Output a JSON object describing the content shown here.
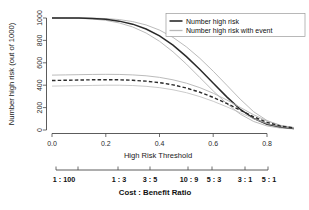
{
  "chart_data": {
    "type": "line",
    "title": "",
    "xlabel": "High Risk Threshold",
    "ylabel": "Number high risk (out of 1000)",
    "xlim": [
      -0.02,
      0.92
    ],
    "ylim": [
      0,
      1030
    ],
    "xticks": [
      0.0,
      0.2,
      0.4,
      0.6,
      0.8
    ],
    "xticklabels": [
      "0.0",
      "0.2",
      "0.4",
      "0.6",
      "0.8"
    ],
    "yticks": [
      0,
      200,
      400,
      600,
      800,
      1000
    ],
    "yticklabels": [
      "0",
      "200",
      "400",
      "600",
      "800",
      "1000"
    ],
    "grid": false,
    "legend": {
      "position": "top-right",
      "entries": [
        {
          "label": "Number high risk",
          "style": "solid-dark",
          "color": "#2a2a2a"
        },
        {
          "label": "Number high risk with event",
          "style": "solid-light",
          "color": "#b9b9b9"
        }
      ]
    },
    "secondary_axis": {
      "title": "Cost : Benefit Ratio",
      "ticks": [
        0.01,
        0.1,
        0.25,
        0.375,
        0.526,
        0.625,
        0.75,
        0.833
      ],
      "labels": [
        "1 : 100",
        "",
        "1 : 3",
        "3 : 5",
        "10 : 9",
        "5 : 3",
        "3 : 1",
        "5 : 1"
      ],
      "label_positions": [
        0.015,
        null,
        0.25,
        0.375,
        0.526,
        0.625,
        0.75,
        0.833
      ]
    },
    "x": [
      0.0,
      0.05,
      0.1,
      0.15,
      0.2,
      0.25,
      0.3,
      0.35,
      0.4,
      0.45,
      0.5,
      0.55,
      0.6,
      0.65,
      0.7,
      0.75,
      0.8,
      0.85,
      0.9
    ],
    "series": [
      {
        "name": "Number high risk",
        "style": "solid-dark",
        "values": [
          1000,
          1000,
          999,
          996,
          988,
          972,
          945,
          902,
          840,
          757,
          655,
          540,
          418,
          296,
          185,
          103,
          52,
          26,
          14
        ]
      },
      {
        "name": "Number high risk upper CI",
        "style": "solid-light",
        "values": [
          1000,
          1000,
          1000,
          999,
          995,
          986,
          968,
          938,
          892,
          827,
          742,
          640,
          524,
          400,
          275,
          163,
          84,
          40,
          20
        ]
      },
      {
        "name": "Number high risk lower CI",
        "style": "solid-light",
        "values": [
          1000,
          999,
          997,
          991,
          979,
          956,
          920,
          866,
          792,
          698,
          588,
          468,
          348,
          236,
          142,
          76,
          36,
          17,
          10
        ]
      },
      {
        "name": "Number high risk with event",
        "style": "dashed-dark",
        "values": [
          442,
          444,
          446,
          448,
          449,
          448,
          444,
          436,
          423,
          403,
          375,
          337,
          291,
          237,
          178,
          118,
          68,
          35,
          18
        ]
      },
      {
        "name": "Number high risk with event upper CI",
        "style": "solid-light",
        "values": [
          490,
          492,
          494,
          496,
          497,
          496,
          492,
          484,
          470,
          448,
          418,
          378,
          328,
          268,
          202,
          136,
          80,
          42,
          22
        ]
      },
      {
        "name": "Number high risk with event lower CI",
        "style": "dotted-light",
        "values": [
          392,
          394,
          396,
          398,
          400,
          400,
          397,
          390,
          378,
          359,
          333,
          298,
          256,
          207,
          154,
          101,
          57,
          29,
          15
        ]
      }
    ]
  }
}
